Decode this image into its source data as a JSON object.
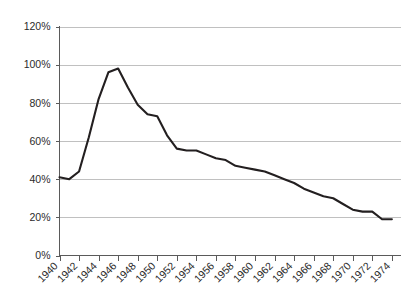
{
  "chart_data": {
    "type": "line",
    "title": "",
    "subtitle": "",
    "xlabel": "",
    "ylabel": "",
    "xlim": [
      1940,
      1975
    ],
    "ylim": [
      0,
      120
    ],
    "grid": true,
    "legend": "none",
    "y_tick_labels": [
      "120%",
      "100%",
      "80%",
      "60%",
      "40%",
      "20%",
      "0%"
    ],
    "y_tick_values": [
      120,
      100,
      80,
      60,
      40,
      20,
      0
    ],
    "x_tick_labels": [
      "1940",
      "1942",
      "1944",
      "1946",
      "1948",
      "1950",
      "1952",
      "1954",
      "1956",
      "1958",
      "1960",
      "1962",
      "1964",
      "1966",
      "1968",
      "1970",
      "1972",
      "1974"
    ],
    "x_tick_values": [
      1940,
      1942,
      1944,
      1946,
      1948,
      1950,
      1952,
      1954,
      1956,
      1958,
      1960,
      1962,
      1964,
      1966,
      1968,
      1970,
      1972,
      1974
    ],
    "series": [
      {
        "name": "value",
        "color": "#231f20",
        "x": [
          1940,
          1941,
          1942,
          1943,
          1944,
          1945,
          1946,
          1947,
          1948,
          1949,
          1950,
          1951,
          1952,
          1953,
          1954,
          1955,
          1956,
          1957,
          1958,
          1959,
          1960,
          1961,
          1962,
          1963,
          1964,
          1965,
          1966,
          1967,
          1968,
          1969,
          1970,
          1971,
          1972,
          1973,
          1974
        ],
        "values": [
          41,
          40,
          44,
          62,
          82,
          96,
          98,
          88,
          79,
          74,
          73,
          63,
          56,
          55,
          55,
          53,
          51,
          50,
          47,
          46,
          45,
          44,
          42,
          40,
          38,
          35,
          33,
          31,
          30,
          27,
          24,
          23,
          23,
          19,
          19
        ]
      }
    ]
  },
  "colors": {
    "line": "#231f20",
    "grid": "#b9b9b9",
    "axis": "#5a5a5a",
    "text": "#2b2b2b",
    "background": "#ffffff"
  }
}
